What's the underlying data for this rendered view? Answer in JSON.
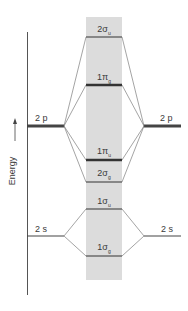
{
  "axis": {
    "label": "Energy",
    "arrow": "up-arrow-icon"
  },
  "atomic_orbitals": {
    "left": [
      {
        "label": "2 p",
        "y": 126
      },
      {
        "label": "2 s",
        "y": 236
      }
    ],
    "right": [
      {
        "label": "2 p",
        "y": 126
      },
      {
        "label": "2 s",
        "y": 236
      }
    ]
  },
  "molecular_orbitals": [
    {
      "main": "2σ",
      "sub": "u",
      "y": 37
    },
    {
      "main": "1π",
      "sub": "g",
      "y": 85
    },
    {
      "main": "1π",
      "sub": "u",
      "y": 160
    },
    {
      "main": "2σ",
      "sub": "g",
      "y": 182
    },
    {
      "main": "1σ",
      "sub": "u",
      "y": 209
    },
    {
      "main": "1σ",
      "sub": "g",
      "y": 256
    }
  ],
  "colors": {
    "mo_band": "#dcdcdc",
    "line": "#333333",
    "connector": "#666666"
  }
}
